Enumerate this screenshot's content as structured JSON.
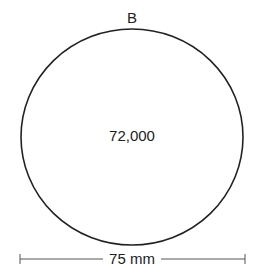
{
  "diagram": {
    "circle_label": "B",
    "center_value": "72,000",
    "dimension_label": "75 mm",
    "colors": {
      "stroke": "#222222",
      "dimension_line": "#555555",
      "background": "#ffffff"
    }
  }
}
